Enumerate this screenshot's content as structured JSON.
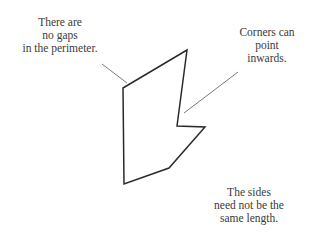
{
  "diagram": {
    "annotations": [
      {
        "id": "gaps",
        "lines": [
          "There are",
          "no gaps",
          "in the perimeter."
        ]
      },
      {
        "id": "corners",
        "lines": [
          "Corners can",
          "point",
          "inwards."
        ]
      },
      {
        "id": "sides",
        "lines": [
          "The sides",
          "need not be the",
          "same length."
        ]
      }
    ],
    "polygon": {
      "points": [
        [
          123,
          88
        ],
        [
          187,
          50
        ],
        [
          177,
          126
        ],
        [
          205,
          127
        ],
        [
          169,
          168
        ],
        [
          124,
          184
        ]
      ],
      "stroke": "#2a2a2a"
    },
    "leader_lines": [
      {
        "from": "gaps",
        "x1": 102,
        "y1": 64,
        "x2": 127,
        "y2": 83
      },
      {
        "from": "corners",
        "x1": 238,
        "y1": 72,
        "x2": 184,
        "y2": 113
      }
    ],
    "leader_color": "#7a7a7a"
  }
}
